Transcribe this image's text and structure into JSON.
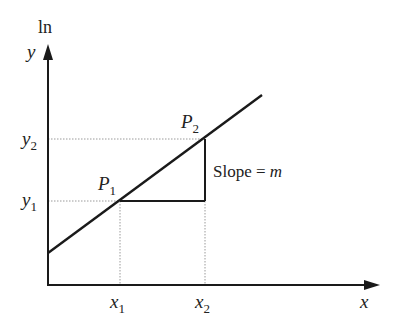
{
  "diagram": {
    "y_axis": {
      "prefix": "ln",
      "label": "y"
    },
    "x_axis": {
      "label": "x"
    },
    "points": [
      {
        "name": "P",
        "sub": "1",
        "x_label": "x",
        "x_sub": "1",
        "y_label": "y",
        "y_sub": "1"
      },
      {
        "name": "P",
        "sub": "2",
        "x_label": "x",
        "x_sub": "2",
        "y_label": "y",
        "y_sub": "2"
      }
    ],
    "slope_label": {
      "text": "Slope = ",
      "var": "m"
    },
    "colors": {
      "line": "#1a1a1a",
      "guide": "#9a9a9a"
    }
  }
}
